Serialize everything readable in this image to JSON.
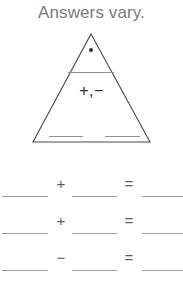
{
  "page": {
    "title": "Answers vary.",
    "background_color": "#ffffff",
    "title_color": "#77787b",
    "line_color": "#9a9c9f",
    "ink_color": "#2f2f2f"
  },
  "fact_triangle": {
    "dot": "•",
    "blank_top": "",
    "operators": "+,−",
    "blank_bottom_left": "",
    "blank_bottom_right": ""
  },
  "equations": [
    {
      "blank_1": "",
      "operator": "+",
      "blank_2": "",
      "equals": "=",
      "blank_3": ""
    },
    {
      "blank_1": "",
      "operator": "+",
      "blank_2": "",
      "equals": "=",
      "blank_3": ""
    },
    {
      "blank_1": "",
      "operator": "−",
      "blank_2": "",
      "equals": "=",
      "blank_3": ""
    }
  ]
}
